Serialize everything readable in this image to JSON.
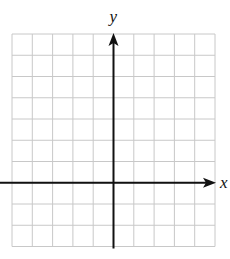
{
  "diagram": {
    "type": "coordinate-plane",
    "grid": {
      "columns": 10,
      "rows": 10,
      "left": 12,
      "top": 34,
      "cell_width": 20.3,
      "cell_height": 21.25,
      "line_color": "#c8c8c8"
    },
    "axes": {
      "color": "#111111",
      "y_axis_column": 5,
      "x_axis_row": 7,
      "x_label": "x",
      "y_label": "y"
    }
  }
}
